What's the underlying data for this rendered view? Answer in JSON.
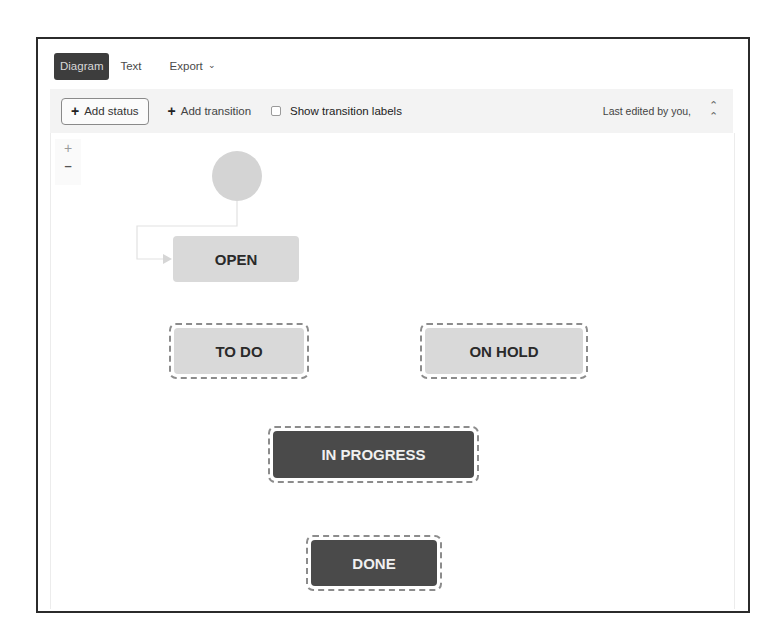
{
  "tabs": [
    {
      "label": "Diagram",
      "active": true
    },
    {
      "label": "Text",
      "active": false
    },
    {
      "label": "Export",
      "active": false,
      "has_dropdown": true
    }
  ],
  "toolbar": {
    "add_status_label": "Add status",
    "add_transition_label": "Add transition",
    "show_transition_labels_label": "Show transition labels",
    "show_transition_labels_checked": false,
    "last_edited_text": "Last edited by you,",
    "collapse_icon": "˄˄",
    "plus_glyph": "+"
  },
  "zoom_controls": {
    "zoom_in": "+",
    "zoom_out": "–"
  },
  "diagram": {
    "start_node": {
      "shape": "circle"
    },
    "statuses": [
      {
        "id": "open",
        "label": "OPEN",
        "style": "light",
        "selected": false
      },
      {
        "id": "todo",
        "label": "TO DO",
        "style": "light",
        "selected": true
      },
      {
        "id": "onhold",
        "label": "ON HOLD",
        "style": "light",
        "selected": true
      },
      {
        "id": "inprogress",
        "label": "IN PROGRESS",
        "style": "dark",
        "selected": true
      },
      {
        "id": "done",
        "label": "DONE",
        "style": "dark",
        "selected": true
      }
    ],
    "transitions": [
      {
        "from": "start",
        "to": "open"
      }
    ]
  },
  "colors": {
    "active_tab_bg": "#3d3d3d",
    "toolbar_bg": "#f3f3f3",
    "status_light": "#d9d9d9",
    "status_dark": "#4a4a4a",
    "selection_dash": "#8c8c8c",
    "start_node": "#d4d4d4"
  }
}
